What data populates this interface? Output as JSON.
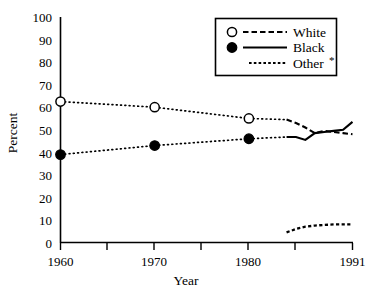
{
  "chart_data": {
    "type": "line",
    "title": "",
    "xlabel": "Year",
    "ylabel": "Percent",
    "xlim": [
      1960,
      1991
    ],
    "ylim": [
      0,
      100
    ],
    "grid": false,
    "legend_position": "top-right",
    "y_ticks": [
      0,
      10,
      20,
      30,
      40,
      50,
      60,
      70,
      80,
      90,
      100
    ],
    "y_tick_labels": [
      "0",
      "10",
      "20",
      "30",
      "40",
      "50",
      "60",
      "70",
      "80",
      "90",
      "100"
    ],
    "x_ticks": [
      1960,
      1965,
      1970,
      1975,
      1980,
      1985,
      1991
    ],
    "x_tick_labels": [
      "1960",
      "",
      "1970",
      "",
      "1980",
      "",
      "1991"
    ],
    "x_labeled_ticks": [
      {
        "year": 1960,
        "label": "1960"
      },
      {
        "year": 1970,
        "label": "1970"
      },
      {
        "year": 1980,
        "label": "1980"
      },
      {
        "year": 1991,
        "label": "1991"
      }
    ],
    "series": [
      {
        "name": "White",
        "marker": "open-circle",
        "line_style": "dotted-then-dashed",
        "color": "#000000",
        "markers": [
          {
            "x": 1960,
            "y": 62.5
          },
          {
            "x": 1970,
            "y": 60.0
          },
          {
            "x": 1980,
            "y": 55.0
          }
        ],
        "dotted_segment": {
          "x": [
            1960,
            1970,
            1980,
            1984
          ],
          "y": [
            62.5,
            60.0,
            55.0,
            54.5
          ]
        },
        "dashed_segment": {
          "x": [
            1984,
            1985,
            1986,
            1987,
            1988,
            1989,
            1990,
            1991
          ],
          "y": [
            54.5,
            53.0,
            51.0,
            48.5,
            49.5,
            49.0,
            48.5,
            48.0
          ]
        }
      },
      {
        "name": "Black",
        "marker": "filled-circle",
        "line_style": "dotted-then-solid",
        "color": "#000000",
        "markers": [
          {
            "x": 1960,
            "y": 39.0
          },
          {
            "x": 1970,
            "y": 43.0
          },
          {
            "x": 1980,
            "y": 46.0
          }
        ],
        "dotted_segment": {
          "x": [
            1960,
            1970,
            1980,
            1984
          ],
          "y": [
            39.0,
            43.0,
            46.0,
            46.8
          ]
        },
        "solid_segment": {
          "x": [
            1984,
            1985,
            1986,
            1987,
            1988,
            1989,
            1990,
            1991
          ],
          "y": [
            46.8,
            46.8,
            45.5,
            48.5,
            49.0,
            49.5,
            50.0,
            53.5
          ]
        }
      },
      {
        "name": "Other *",
        "marker": "none",
        "line_style": "dashed",
        "color": "#000000",
        "dashed_segment": {
          "x": [
            1984,
            1985,
            1986,
            1987,
            1988,
            1989,
            1990,
            1991
          ],
          "y": [
            4.5,
            6.0,
            7.0,
            7.5,
            7.8,
            8.0,
            8.0,
            8.0
          ]
        }
      }
    ]
  },
  "legend": {
    "entries": [
      {
        "label": "White",
        "marker": "open-circle",
        "line": "dashed"
      },
      {
        "label": "Black",
        "marker": "filled-circle",
        "line": "solid"
      },
      {
        "label": "Other",
        "marker": "none",
        "line": "dotted",
        "footnote": "*"
      }
    ]
  },
  "axes": {
    "y_title": "Percent",
    "x_title": "Year"
  }
}
